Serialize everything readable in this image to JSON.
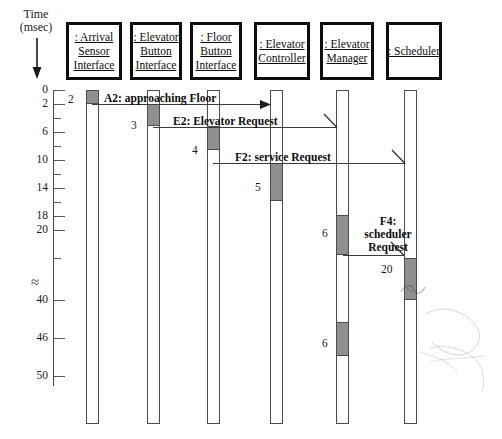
{
  "diagram": {
    "type": "uml-sequence-diagram",
    "width": 502,
    "height": 439
  },
  "time_axis": {
    "label_line1": "Time",
    "label_line2": "(msec)",
    "unit": "msec",
    "direction": "downward",
    "break_symbol": "≈",
    "ticks": [
      {
        "label": "0",
        "y": 90,
        "major": true
      },
      {
        "label": "2",
        "y": 104,
        "major": true
      },
      {
        "label": "",
        "y": 118,
        "major": false
      },
      {
        "label": "6",
        "y": 132,
        "major": true
      },
      {
        "label": "",
        "y": 146,
        "major": false
      },
      {
        "label": "10",
        "y": 160,
        "major": true
      },
      {
        "label": "",
        "y": 174,
        "major": false
      },
      {
        "label": "14",
        "y": 188,
        "major": true
      },
      {
        "label": "",
        "y": 202,
        "major": false
      },
      {
        "label": "18",
        "y": 216,
        "major": true
      },
      {
        "label": "20",
        "y": 230,
        "major": true
      },
      {
        "label": "",
        "y": 258,
        "major": false
      },
      {
        "label": "40",
        "y": 300,
        "major": true
      },
      {
        "label": "46",
        "y": 338,
        "major": true
      },
      {
        "label": "50",
        "y": 376,
        "major": true
      }
    ]
  },
  "objects": [
    {
      "id": "arrival-sensor-interface",
      "lines": [
        ": Arrival",
        "Sensor",
        "Interface"
      ],
      "name": ": Arrival Sensor Interface",
      "x": 66,
      "width": 56
    },
    {
      "id": "elevator-button-interface",
      "lines": [
        ": Elevator",
        "Button",
        "Interface"
      ],
      "name": ": Elevator Button Interface",
      "x": 130,
      "width": 52
    },
    {
      "id": "floor-button-interface",
      "lines": [
        ": Floor",
        "Button",
        "Interface"
      ],
      "name": ": Floor Button Interface",
      "x": 190,
      "width": 52
    },
    {
      "id": "elevator-controller",
      "lines": [
        ": Elevator",
        "Controller"
      ],
      "name": ": Elevator Controller",
      "x": 254,
      "width": 56
    },
    {
      "id": "elevator-manager",
      "lines": [
        ": Elevator",
        "Manager"
      ],
      "name": ": Elevator Manager",
      "x": 320,
      "width": 54
    },
    {
      "id": "scheduler",
      "lines": [
        ": Scheduler"
      ],
      "name": ": Scheduler",
      "x": 386,
      "width": 56
    }
  ],
  "lifelines": [
    {
      "object": "arrival-sensor-interface",
      "x": 86,
      "top": 90,
      "bottom": 424,
      "width": 13
    },
    {
      "object": "elevator-button-interface",
      "x": 147,
      "top": 90,
      "bottom": 424,
      "width": 13
    },
    {
      "object": "floor-button-interface",
      "x": 207,
      "top": 90,
      "bottom": 424,
      "width": 13
    },
    {
      "object": "elevator-controller",
      "x": 270,
      "top": 90,
      "bottom": 424,
      "width": 13
    },
    {
      "object": "elevator-manager",
      "x": 336,
      "top": 90,
      "bottom": 424,
      "width": 13
    },
    {
      "object": "scheduler",
      "x": 404,
      "top": 90,
      "bottom": 424,
      "width": 13
    }
  ],
  "activations": [
    {
      "object": "arrival-sensor-interface",
      "x": 86,
      "top": 90,
      "height": 14,
      "label": "2",
      "label_x": 68,
      "label_y": 93
    },
    {
      "object": "elevator-button-interface",
      "x": 147,
      "top": 104,
      "height": 22,
      "label": "3",
      "label_x": 131,
      "label_y": 119
    },
    {
      "object": "floor-button-interface",
      "x": 207,
      "top": 126,
      "height": 24,
      "label": "4",
      "label_x": 192,
      "label_y": 144
    },
    {
      "object": "elevator-controller",
      "x": 270,
      "top": 163,
      "height": 38,
      "label": "5",
      "label_x": 255,
      "label_y": 181
    },
    {
      "object": "elevator-manager",
      "x": 336,
      "top": 215,
      "height": 40,
      "label": "6",
      "label_x": 322,
      "label_y": 227
    },
    {
      "object": "scheduler",
      "x": 404,
      "top": 258,
      "height": 42,
      "label": "20",
      "label_x": 381,
      "label_y": 263
    },
    {
      "object": "elevator-manager",
      "x": 336,
      "top": 322,
      "height": 34,
      "label": "6",
      "label_x": 322,
      "label_y": 337
    }
  ],
  "messages": [
    {
      "id": "A2",
      "label": "A2: approaching Floor",
      "from": "arrival-sensor-interface",
      "to": "elevator-controller",
      "y": 104,
      "x_start": 92,
      "x_end": 270,
      "label_x": 104,
      "label_y": 92,
      "arrow": "filled"
    },
    {
      "id": "E2",
      "label": "E2: Elevator Request",
      "from": "elevator-button-interface",
      "to": "elevator-manager",
      "y": 127,
      "x_start": 153,
      "x_end": 337,
      "label_x": 173,
      "label_y": 115,
      "arrow": "open"
    },
    {
      "id": "F2",
      "label": "F2: service Request",
      "from": "floor-button-interface",
      "to": "scheduler",
      "y": 163,
      "x_start": 213,
      "x_end": 405,
      "label_x": 235,
      "label_y": 151,
      "arrow": "open"
    },
    {
      "id": "F4",
      "label": "F4: scheduler Request",
      "label_lines": [
        "F4:",
        "scheduler",
        "Request"
      ],
      "from": "elevator-manager",
      "to": "scheduler",
      "y": 255,
      "x_start": 343,
      "x_end": 404,
      "label_x": 355,
      "label_y": 215,
      "arrow": "open"
    }
  ],
  "annotations": {
    "axis_break_note": "Time scale break between 20 and 40 msec"
  }
}
